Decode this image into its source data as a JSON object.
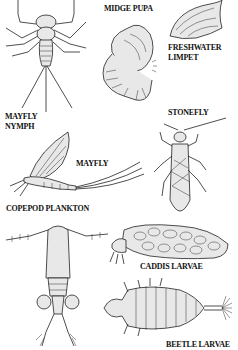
{
  "labels": {
    "midge_pupa": "MIDGE PUPA",
    "freshwater_limpet_1": "FRESHWATER",
    "freshwater_limpet_2": "LIMPET",
    "mayfly_nymph_1": "MAYFLY",
    "mayfly_nymph_2": "NYMPH",
    "stonefly": "STONEFLY",
    "mayfly": "MAYFLY",
    "copepod_plankton": "COPEPOD PLANKTON",
    "caddis_larvae": "CADDIS LARVAE",
    "beetle_larvae": "BEETLE LARVAE"
  },
  "colors": {
    "ink": "#222222",
    "background": "#ffffff"
  }
}
